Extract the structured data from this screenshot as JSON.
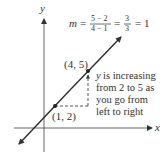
{
  "axes": {
    "x_label": "x",
    "y_label": "y"
  },
  "equation": {
    "lhs": "m",
    "eq": "=",
    "frac1_num": "5 − 2",
    "frac1_den": "4 − 1",
    "frac2_num": "3",
    "frac2_den": "3",
    "result": "= 1"
  },
  "points": [
    {
      "label": "(1, 2)",
      "x": 1,
      "y": 2
    },
    {
      "label": "(4, 5)",
      "x": 4,
      "y": 5
    }
  ],
  "annotation": {
    "var": "y",
    "lines": [
      "is increasing",
      "from 2 to 5 as",
      "you go from",
      "left to right"
    ]
  },
  "colors": {
    "line": "#2b2b2b",
    "axis": "#444444",
    "text": "#333333"
  }
}
